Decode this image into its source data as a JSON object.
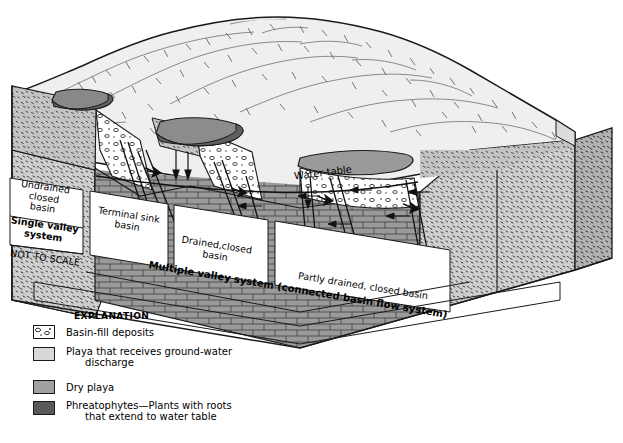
{
  "figure": {
    "type": "block-diagram",
    "scale_note": "NOT TO SCALE"
  },
  "map_labels": {
    "water_table": "Water table",
    "undrained_closed_basin": "Undrained\nclosed\nbasin",
    "single_valley_system": "Single valley\nsystem",
    "not_to_scale": "NOT TO SCALE",
    "terminal_sink_basin": "Terminal sink\nbasin",
    "drained_closed_basin": "Drained,closed\nbasin",
    "partly_drained_closed_basin": "Partly drained, closed basin",
    "multiple_valley_system": "Multiple valley system (connected basin flow system)"
  },
  "legend": {
    "title": "EXPLANATION",
    "items": [
      {
        "label": "Basin-fill deposits",
        "swatch": "basin-fill-pattern",
        "color": "#ffffff"
      },
      {
        "label": "Playa that receives ground-water\n      discharge",
        "swatch": "playa-recharge-light",
        "color": "#d8d8d8"
      },
      {
        "label": "Dry playa",
        "swatch": "dry-playa-mid",
        "color": "#a0a0a0"
      },
      {
        "label": "Phreatophytes—Plants with roots\n      that extend to water table",
        "swatch": "phreatophytes-dark",
        "color": "#595959"
      }
    ]
  },
  "colors": {
    "mountain": "#efefef",
    "basin_fill_stipple": "#cfcfcf",
    "basin_fill_dark": "#b0b0b0",
    "bedrock_brick": "#9a9a9a",
    "dry_playa": "#a0a0a0",
    "playa_light": "#d9d9d9",
    "phreatophyte": "#5a5a5a",
    "outline": "#1a1a1a"
  }
}
